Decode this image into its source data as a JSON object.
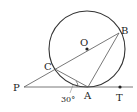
{
  "diagram": {
    "type": "geometry",
    "points": {
      "O": {
        "label": "O",
        "x": 87,
        "y": 49
      },
      "B": {
        "label": "B",
        "x": 119,
        "y": 33
      },
      "C": {
        "label": "C",
        "x": 55,
        "y": 67
      },
      "P": {
        "label": "P",
        "x": 24,
        "y": 87
      },
      "A": {
        "label": "A",
        "x": 88,
        "y": 87
      },
      "T": {
        "label": "T",
        "x": 120,
        "y": 87
      }
    },
    "circle": {
      "cx": 87,
      "cy": 49,
      "r": 38
    },
    "angle_label": "30°",
    "colors": {
      "stroke": "#333333",
      "thin": "#555555"
    }
  }
}
